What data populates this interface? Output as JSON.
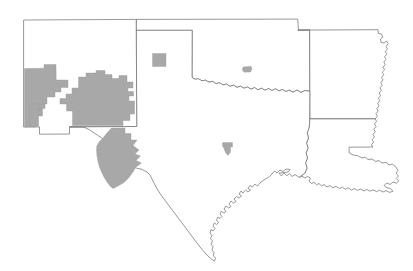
{
  "map": {
    "title": "South Central United States county highlight map",
    "projection_note": "plate-carree approximate",
    "background_color": "#ffffff",
    "outline_color": "#6b6b6b",
    "highlight_color": "#a8a8a8",
    "highlight_stroke_color": "#9a9a9a",
    "states": [
      {
        "id": "new-mexico",
        "name": "New Mexico"
      },
      {
        "id": "texas",
        "name": "Texas"
      },
      {
        "id": "oklahoma",
        "name": "Oklahoma"
      },
      {
        "id": "arkansas",
        "name": "Arkansas"
      },
      {
        "id": "louisiana",
        "name": "Louisiana"
      }
    ],
    "highlight_groups": [
      {
        "id": "southern-new-mexico-block",
        "label": "Southern New Mexico highlighted counties",
        "state": "New Mexico",
        "fill": "#a8a8a8"
      },
      {
        "id": "big-bend-block",
        "label": "Big Bend West Texas highlighted counties",
        "state": "Texas",
        "fill": "#a8a8a8"
      }
    ],
    "highlight_counties_isolated": [
      {
        "id": "texas-panhandle-county",
        "label": "Texas Panhandle highlighted county",
        "state": "Texas",
        "fill": "#a8a8a8"
      },
      {
        "id": "southern-oklahoma-county",
        "label": "Southern Oklahoma highlighted county",
        "state": "Oklahoma",
        "fill": "#a8a8a8"
      },
      {
        "id": "central-texas-county",
        "label": "Central Texas highlighted county",
        "state": "Texas",
        "fill": "#a8a8a8"
      }
    ],
    "legend": {
      "visible": false,
      "items": []
    },
    "labels": {
      "visible": false,
      "items": []
    }
  }
}
